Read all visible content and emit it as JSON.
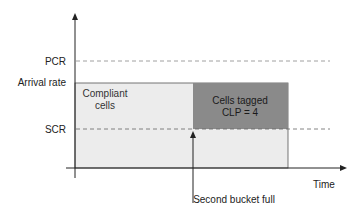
{
  "diagram": {
    "y_labels": {
      "pcr": "PCR",
      "arrival_rate": "Arrival rate",
      "scr": "SCR"
    },
    "x_label": "Time",
    "regions": {
      "compliant": {
        "line1": "Compliant",
        "line2": "cells",
        "color": "#ececec"
      },
      "tagged": {
        "line1": "Cells tagged",
        "line2": "CLP = 4",
        "color": "#8a8a8a"
      }
    },
    "annotation": "Second bucket full"
  }
}
